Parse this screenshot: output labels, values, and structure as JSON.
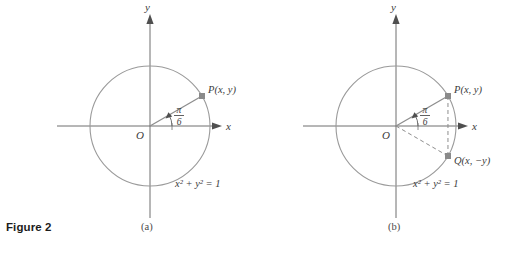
{
  "figure": {
    "caption": "Figure 2",
    "panels": [
      {
        "id": "a",
        "sublabel": "(a)",
        "center": {
          "x": 150,
          "y": 126
        },
        "radius": 60,
        "axis_labels": {
          "x": "x",
          "y": "y"
        },
        "origin_label": "O",
        "angle_label_numerator": "π",
        "angle_label_denominator": "6",
        "angle_degrees": 30,
        "points": [
          {
            "name": "P",
            "label": "P(x, y)",
            "angle_degrees": 30
          }
        ],
        "equation": "x² + y² = 1"
      },
      {
        "id": "b",
        "sublabel": "(b)",
        "center": {
          "x": 396,
          "y": 126
        },
        "radius": 60,
        "axis_labels": {
          "x": "x",
          "y": "y"
        },
        "origin_label": "O",
        "angle_label_numerator": "π",
        "angle_label_denominator": "6",
        "angle_degrees": 30,
        "points": [
          {
            "name": "P",
            "label": "P(x, y)",
            "angle_degrees": 30
          },
          {
            "name": "Q",
            "label": "Q(x, −y)",
            "angle_degrees": -30
          }
        ],
        "equation": "x² + y² = 1"
      }
    ]
  },
  "colors": {
    "background": "#ffffff",
    "stroke": "#8d8d8d",
    "axis": "#6e6e6e",
    "text": "#3b3b3b",
    "caption": "#1c1c1c",
    "marker": "#8a8a8a"
  }
}
